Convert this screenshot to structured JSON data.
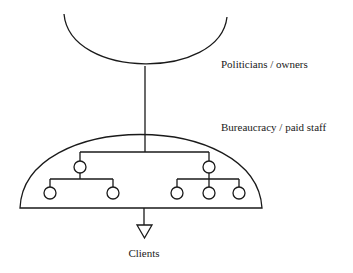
{
  "diagram": {
    "labels": {
      "owners": "Politicians / owners",
      "bureaucracy": "Bureaucracy / paid staff",
      "clients": "Clients"
    },
    "colors": {
      "stroke": "#1a1a1a",
      "background": "#ffffff"
    },
    "hierarchy": {
      "top_level_units": 2,
      "left_unit_subordinates": 2,
      "right_unit_subordinates": 3
    }
  }
}
